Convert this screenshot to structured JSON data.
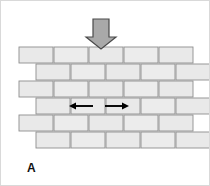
{
  "figure": {
    "panel_label": "A",
    "width": 210,
    "height": 186,
    "background_color": "#ffffff",
    "border_color": "#d9d9d9"
  },
  "colors": {
    "brick_fill": "#e9e9e9",
    "brick_fill_alt": "#ececec",
    "brick_stroke": "#8e8e8e",
    "load_arrow_fill": "#a9a9a9",
    "load_arrow_stroke": "#4a4a4a",
    "lateral_arrow_color": "#000000",
    "label_color": "#111111"
  },
  "load_arrow": {
    "name": "vertical-load-arrow",
    "direction": "down",
    "x": 100,
    "y_top": 18,
    "y_tip": 48,
    "shaft_width": 16,
    "head_width": 30,
    "meaning": "applied vertical compressive load"
  },
  "lateral_arrows": [
    {
      "name": "lateral-arrow-left",
      "direction": "left",
      "x_start": 92,
      "x_end": 68,
      "y": 105,
      "meaning": "lateral expansion to the left"
    },
    {
      "name": "lateral-arrow-right",
      "direction": "right",
      "x_start": 104,
      "x_end": 128,
      "y": 105,
      "meaning": "lateral expansion to the right"
    }
  ],
  "wall": {
    "name": "brick-wall",
    "bond_pattern": "running bond",
    "row_count": 6,
    "row_height": 16,
    "brick_width": 34,
    "mortar_gap": 1,
    "top_y": 46,
    "rows": [
      {
        "index": 1,
        "y": 46,
        "x_start": 18,
        "offset": 0,
        "brick_count": 5,
        "bricks": [
          34,
          34,
          34,
          34,
          34
        ]
      },
      {
        "index": 2,
        "y": 63,
        "x_start": 35,
        "offset": 17,
        "brick_count": 5,
        "bricks": [
          34,
          34,
          34,
          34,
          34
        ]
      },
      {
        "index": 3,
        "y": 80,
        "x_start": 18,
        "offset": 0,
        "brick_count": 5,
        "bricks": [
          34,
          34,
          34,
          34,
          34
        ]
      },
      {
        "index": 4,
        "y": 97,
        "x_start": 35,
        "offset": 17,
        "brick_count": 5,
        "bricks": [
          34,
          34,
          34,
          34,
          34
        ]
      },
      {
        "index": 5,
        "y": 114,
        "x_start": 18,
        "offset": 0,
        "brick_count": 5,
        "bricks": [
          34,
          34,
          34,
          34,
          34
        ]
      },
      {
        "index": 6,
        "y": 131,
        "x_start": 35,
        "offset": 17,
        "brick_count": 5,
        "bricks": [
          34,
          34,
          34,
          34,
          34
        ]
      }
    ]
  }
}
